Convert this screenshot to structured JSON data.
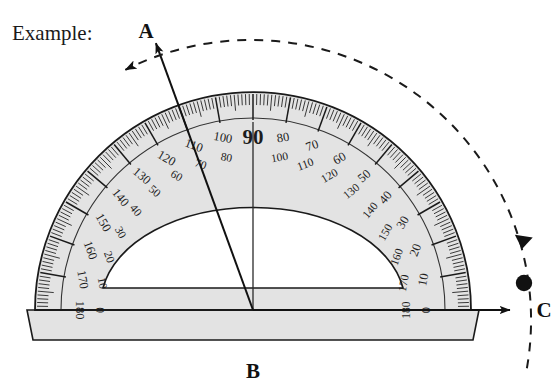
{
  "figure": {
    "caption": "Example:",
    "type": "protractor-angle-diagram"
  },
  "points": [
    {
      "name": "A",
      "label": "A",
      "x": 146,
      "y": 30
    },
    {
      "name": "B",
      "label": "B",
      "x": 253,
      "y": 370
    },
    {
      "name": "C",
      "label": "C",
      "x": 524,
      "y": 307
    }
  ],
  "vertex": {
    "label": "B",
    "x": 253,
    "y": 310
  },
  "rays": [
    {
      "name": "ray-BA",
      "from": "B",
      "to": "A",
      "arrow": true
    },
    {
      "name": "ray-BC",
      "from": "B",
      "to": "C",
      "arrow": true
    }
  ],
  "arc": {
    "name": "measurement-arc",
    "style": "dashed",
    "arrow_start": "A",
    "arrow_end": "C"
  },
  "protractor": {
    "center_x": 253,
    "center_y": 310,
    "outer_radius": 218,
    "inner_cut_radius": 92,
    "body_color": "#e3e3e3",
    "edge_color": "#1a1a1a",
    "center_label": "90",
    "base_depth": 30,
    "outer_scale": [
      0,
      10,
      20,
      30,
      40,
      50,
      60,
      70,
      80,
      90,
      100,
      110,
      120,
      130,
      140,
      150,
      160,
      170,
      180
    ],
    "inner_scale": [
      180,
      170,
      160,
      150,
      140,
      130,
      120,
      110,
      100,
      90,
      80,
      70,
      60,
      50,
      40,
      30,
      20,
      10,
      0
    ],
    "tick_minor_step": 1,
    "tick_major_step": 10,
    "labeled_pairs": [
      {
        "angle": 0,
        "outer": "0",
        "inner": "180"
      },
      {
        "angle": 10,
        "outer": "10",
        "inner": "170"
      },
      {
        "angle": 20,
        "outer": "20",
        "inner": "160"
      },
      {
        "angle": 30,
        "outer": "30",
        "inner": "150"
      },
      {
        "angle": 40,
        "outer": "40",
        "inner": "140"
      },
      {
        "angle": 50,
        "outer": "50",
        "inner": "130"
      },
      {
        "angle": 60,
        "outer": "60",
        "inner": "120"
      },
      {
        "angle": 70,
        "outer": "70",
        "inner": "110"
      },
      {
        "angle": 80,
        "outer": "80",
        "inner": "100"
      },
      {
        "angle": 90,
        "outer": "90",
        "inner": ""
      },
      {
        "angle": 100,
        "outer": "100",
        "inner": "80"
      },
      {
        "angle": 110,
        "outer": "110",
        "inner": "70"
      },
      {
        "angle": 120,
        "outer": "120",
        "inner": "60"
      },
      {
        "angle": 130,
        "outer": "130",
        "inner": "50"
      },
      {
        "angle": 140,
        "outer": "140",
        "inner": "40"
      },
      {
        "angle": 150,
        "outer": "150",
        "inner": "30"
      },
      {
        "angle": 160,
        "outer": "160",
        "inner": "20"
      },
      {
        "angle": 170,
        "outer": "170",
        "inner": "10"
      },
      {
        "angle": 180,
        "outer": "180",
        "inner": "0"
      }
    ]
  },
  "chart_data": {
    "type": "diagram",
    "title": "Example:",
    "measured_angle_degrees": 110,
    "angle_name": "ABC",
    "vertex": "B",
    "ray_endpoints": [
      "A",
      "C"
    ],
    "instrument": "protractor",
    "scale_range": [
      0,
      180
    ]
  }
}
